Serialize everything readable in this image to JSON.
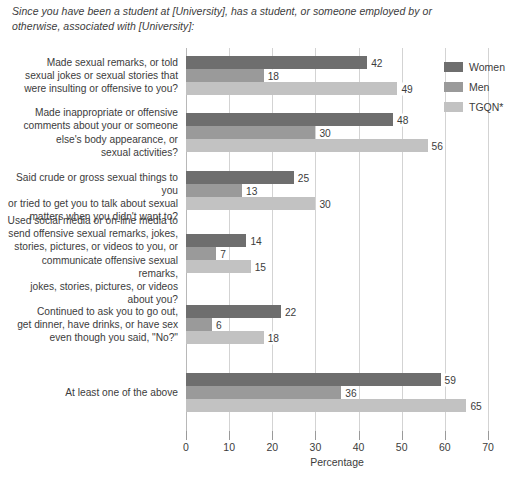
{
  "chart_data": {
    "type": "bar",
    "orientation": "horizontal",
    "grouped": true,
    "title": "Since you have been a student at [University], has a student, or someone employed by or otherwise, associated with [University]:",
    "xlabel": "Percentage",
    "ylabel": "",
    "xlim": [
      0,
      70
    ],
    "xticks": [
      0,
      10,
      20,
      30,
      40,
      50,
      60,
      70
    ],
    "grid": true,
    "grid_axis": "x",
    "legend_position": "right",
    "categories": [
      "Made sexual remarks, or told sexual jokes or sexual stories that were insulting or offensive to you?",
      "Made inappropriate or offensive comments about your or someone else's body appearance, or sexual activities?",
      "Said crude or gross sexual things to you or tried to get you to talk about sexual matters when you didn't want to?",
      "Used social media or on-line media to send offensive sexual remarks, jokes, stories, pictures, or videos to you, or communicate offensive sexual remarks, jokes, stories, pictures, or videos about you?",
      "Continued to ask you to go out, get dinner, have drinks, or have sex even though you said, \"No?\"",
      "At least one of the above"
    ],
    "category_lines": [
      [
        "Made sexual remarks, or told",
        "sexual jokes or sexual stories that",
        "were insulting or offensive to you?"
      ],
      [
        "Made inappropriate or offensive",
        "comments about your or someone",
        "else's body appearance, or",
        "sexual activities?"
      ],
      [
        "Said crude or gross sexual things to you",
        "or tried to get you to talk about sexual",
        "matters when you didn't want to?"
      ],
      [
        "Used social media or on-line media to",
        "send offensive sexual remarks, jokes,",
        "stories, pictures, or videos to you, or",
        "communicate offensive sexual remarks,",
        "jokes, stories, pictures, or videos",
        "about you?"
      ],
      [
        "Continued to ask you to go out,",
        "get dinner, have drinks, or have sex",
        "even though you said, \"No?\""
      ],
      [
        "At least one of the above"
      ]
    ],
    "series": [
      {
        "name": "Women",
        "color": "#6e6e6e",
        "values": [
          42,
          48,
          25,
          14,
          22,
          59
        ]
      },
      {
        "name": "Men",
        "color": "#9a9a9a",
        "values": [
          18,
          30,
          13,
          7,
          6,
          36
        ]
      },
      {
        "name": "TGQN*",
        "color": "#c2c2c2",
        "values": [
          49,
          56,
          30,
          15,
          18,
          65
        ]
      }
    ]
  },
  "legend": {
    "items": [
      {
        "label": "Women"
      },
      {
        "label": "Men"
      },
      {
        "label": "TGQN*"
      }
    ]
  },
  "axis": {
    "title": "Percentage",
    "tick_labels": [
      "0",
      "10",
      "20",
      "30",
      "40",
      "50",
      "60",
      "70"
    ]
  }
}
